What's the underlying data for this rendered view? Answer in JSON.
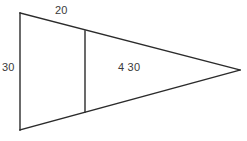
{
  "figure": {
    "kind": "geometry-diagram",
    "background_color": "#ffffff",
    "stroke_color": "#2b2b2b",
    "label_color": "#3a3a3a",
    "labels": {
      "left_side": "30",
      "top_side": "20",
      "interior": "4 30"
    },
    "geometry": {
      "apex": {
        "x": 240,
        "y": 70
      },
      "top_left": {
        "x": 20,
        "y": 13
      },
      "bottom_left": {
        "x": 20,
        "y": 130
      },
      "interior_line": {
        "x": 85,
        "top_y": 31,
        "bottom_y": 112
      }
    }
  }
}
